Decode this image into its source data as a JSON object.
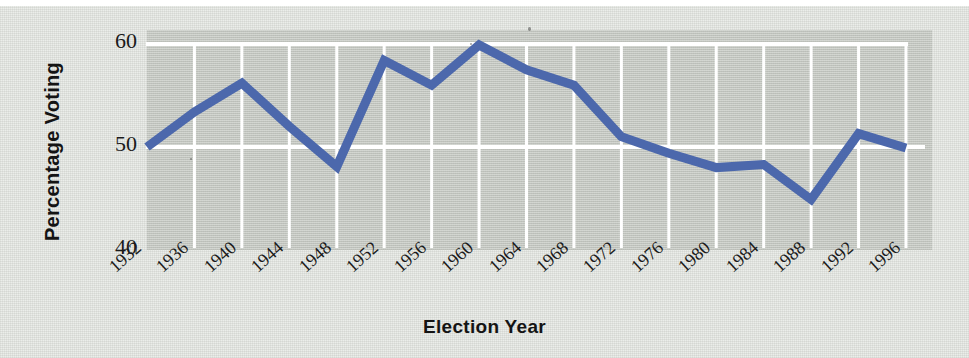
{
  "chart_data": {
    "type": "line",
    "title": "",
    "xlabel": "Election Year",
    "ylabel": "Percentage Voting",
    "categories": [
      "1932",
      "1936",
      "1940",
      "1944",
      "1948",
      "1952",
      "1956",
      "1960",
      "1964",
      "1968",
      "1972",
      "1976",
      "1980",
      "1984",
      "1988",
      "1992",
      "1996"
    ],
    "values": [
      50.0,
      53.4,
      56.2,
      52.0,
      48.1,
      58.4,
      56.0,
      59.9,
      57.5,
      56.0,
      51.0,
      49.4,
      48.0,
      48.3,
      44.9,
      51.3,
      49.9
    ],
    "series": [
      {
        "name": "Percentage Voting",
        "values": [
          50.0,
          53.4,
          56.2,
          52.0,
          48.1,
          58.4,
          56.0,
          59.9,
          57.5,
          56.0,
          51.0,
          49.4,
          48.0,
          48.3,
          44.9,
          51.3,
          49.9
        ]
      }
    ],
    "yticks": [
      40,
      50,
      60
    ],
    "ytick_labels": [
      "40",
      "50",
      "60"
    ],
    "ylim": [
      38.5,
      61.5
    ],
    "xlim": [
      "1932",
      "1996"
    ],
    "grid": "white gridlines, horizontal at 50 and 60, vertical at each election year",
    "legend": "none",
    "line_color": "#4c68ac",
    "line_width": 9,
    "gridline_color": "#ffffff",
    "plot_background": "#b9bdb4",
    "figure_background": "#e9ebe7"
  },
  "axes": {
    "y_title": "Percentage Voting",
    "x_title": "Election Year",
    "y_ticks": [
      "60",
      "50",
      "40"
    ],
    "x_ticks": [
      "1932",
      "1936",
      "1940",
      "1944",
      "1948",
      "1952",
      "1956",
      "1960",
      "1964",
      "1968",
      "1972",
      "1976",
      "1980",
      "1984",
      "1988",
      "1992",
      "1996"
    ]
  }
}
